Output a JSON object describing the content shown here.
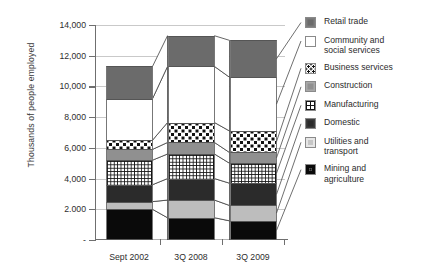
{
  "chart_data": {
    "type": "bar",
    "subtype": "stacked-bar",
    "title": "",
    "xlabel": "",
    "ylabel": "Thousands of people employed",
    "ylim": [
      0,
      14000
    ],
    "ytick_labels": [
      "14,000",
      "12,000",
      "10,000",
      "8,000",
      "6,000",
      "4,000",
      "2.000",
      "-"
    ],
    "ytick_values": [
      14000,
      12000,
      10000,
      8000,
      6000,
      4000,
      2000,
      0
    ],
    "grid": true,
    "legend_position": "right",
    "categories": [
      "Sept 2002",
      "3Q 2008",
      "3Q 2009"
    ],
    "series": [
      {
        "name": "Mining and agriculture",
        "values": [
          2000,
          1450,
          1250
        ]
      },
      {
        "name": "Utilities and transport",
        "values": [
          500,
          1150,
          1000
        ]
      },
      {
        "name": "Domestic",
        "values": [
          1100,
          1400,
          1450
        ]
      },
      {
        "name": "Manufacturing",
        "values": [
          1600,
          1600,
          1300
        ]
      },
      {
        "name": "Construction",
        "values": [
          700,
          750,
          700
        ]
      },
      {
        "name": "Business services",
        "values": [
          600,
          1300,
          1400
        ]
      },
      {
        "name": "Community and social services",
        "values": [
          2700,
          3650,
          3500
        ]
      },
      {
        "name": "Retail trade",
        "values": [
          2100,
          2000,
          2400
        ]
      }
    ],
    "totals": [
      11300,
      13300,
      13000
    ],
    "stack_order_bottom_to_top": [
      "Mining and agriculture",
      "Utilities and transport",
      "Domestic",
      "Manufacturing",
      "Construction",
      "Business services",
      "Community and social services",
      "Retail trade"
    ]
  },
  "axis": {
    "y_title": "Thousands of people employed"
  },
  "legend": {
    "items": [
      {
        "label": "Retail trade",
        "pattern": "solid-dark-gray",
        "color": "#6b6b6b"
      },
      {
        "label": "Community and\nsocial services",
        "pattern": "solid-white",
        "color": "#ffffff"
      },
      {
        "label": "Business services",
        "pattern": "polka-dots",
        "color": "#111111"
      },
      {
        "label": "Construction",
        "pattern": "solid-mid-gray",
        "color": "#909090"
      },
      {
        "label": "Manufacturing",
        "pattern": "grid-checker",
        "color": "#141414"
      },
      {
        "label": "Domestic",
        "pattern": "solid-near-black",
        "color": "#2b2b2b"
      },
      {
        "label": "Utilities and\ntransport",
        "pattern": "solid-light-gray",
        "color": "#bdbdbd"
      },
      {
        "label": "Mining and\nagriculture",
        "pattern": "solid-black",
        "color": "#0a0a0a"
      }
    ]
  }
}
